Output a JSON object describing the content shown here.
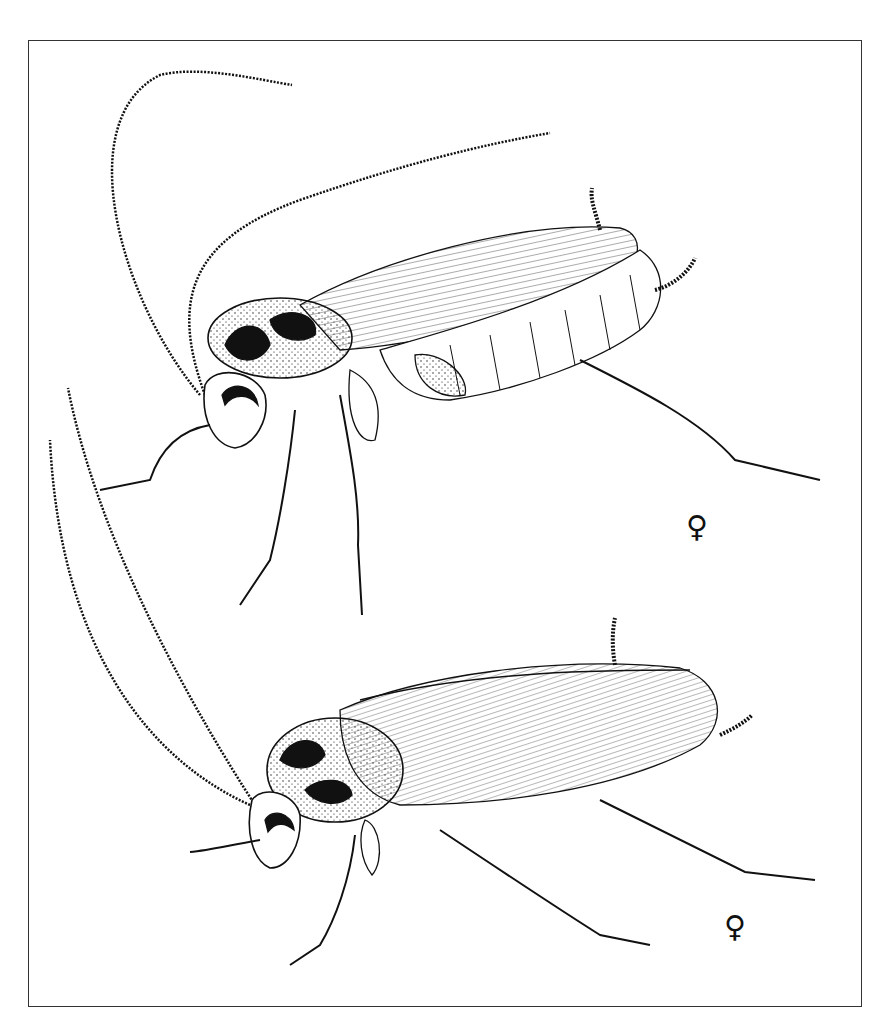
{
  "plate": {
    "description": "Scientific line illustration of two cockroaches (lateral / oblique views)",
    "frame_color": "#333333",
    "ink_color": "#111111",
    "background": "#ffffff"
  },
  "figures": [
    {
      "label": "female-symbol",
      "symbol": "♀",
      "subject": "cockroach, female, upper figure (lateral view, abdomen exposed)"
    },
    {
      "label": "female-symbol",
      "symbol": "♀",
      "subject": "cockroach, female, lower figure (oblique view, wings covering abdomen)"
    }
  ]
}
